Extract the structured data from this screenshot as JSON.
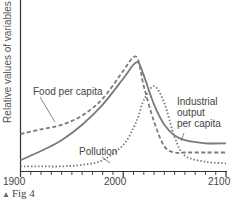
{
  "chart_data": {
    "type": "line",
    "title": "",
    "caption": "Fig 4",
    "xlabel": "",
    "ylabel": "Relative values of variables",
    "xlim": [
      1900,
      2100
    ],
    "x_tick_labels": [
      "1900",
      "2000",
      "2100"
    ],
    "x_minor_tick_step": 10,
    "grid": false,
    "legend": "inline annotations",
    "x": [
      1900,
      1920,
      1940,
      1960,
      1980,
      2000,
      2010,
      2015,
      2020,
      2030,
      2040,
      2050,
      2060,
      2080,
      2100
    ],
    "series": [
      {
        "name": "Food per capita",
        "style": "dashed",
        "values": [
          0.24,
          0.27,
          0.3,
          0.36,
          0.47,
          0.65,
          0.74,
          0.71,
          0.55,
          0.32,
          0.16,
          0.12,
          0.12,
          0.12,
          0.12
        ]
      },
      {
        "name": "Industrial output per capita",
        "style": "solid",
        "values": [
          0.07,
          0.13,
          0.2,
          0.3,
          0.43,
          0.6,
          0.69,
          0.7,
          0.62,
          0.43,
          0.3,
          0.23,
          0.2,
          0.18,
          0.18
        ]
      },
      {
        "name": "Pollution",
        "style": "dotted",
        "values": [
          0.03,
          0.03,
          0.03,
          0.04,
          0.07,
          0.17,
          0.28,
          0.36,
          0.46,
          0.55,
          0.44,
          0.22,
          0.1,
          0.06,
          0.05
        ]
      }
    ],
    "annotations": [
      "Food per capita",
      "Industrial output per capita",
      "Pollution"
    ]
  },
  "labels": {
    "ylabel": "Relative values of variables",
    "food": "Food per capita",
    "industrial_1": "Industrial",
    "industrial_2": "output",
    "industrial_3": "per capita",
    "pollution": "Pollution",
    "tick_1900": "1900",
    "tick_2000": "2000",
    "tick_2100": "2100",
    "caption": "Fig 4",
    "caption_marker": "▲"
  },
  "colors": {
    "axis": "#333333",
    "line": "#777777",
    "text": "#444444"
  }
}
